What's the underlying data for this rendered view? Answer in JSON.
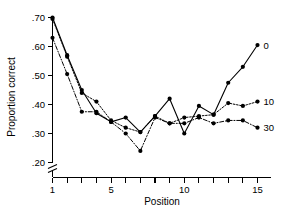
{
  "chart_data": {
    "type": "line",
    "title": "",
    "xlabel": "Position",
    "ylabel": "Proportion correct",
    "xlim": [
      1,
      15
    ],
    "ylim": [
      0.2,
      0.7
    ],
    "grid": false,
    "axis_break_y": true,
    "legend_position": "right-inline",
    "x": [
      1,
      2,
      3,
      4,
      5,
      6,
      7,
      8,
      9,
      10,
      11,
      12,
      13,
      14,
      15
    ],
    "xticks": [
      1,
      2,
      3,
      4,
      5,
      6,
      7,
      8,
      9,
      10,
      11,
      12,
      13,
      14,
      15
    ],
    "xtick_labels": [
      "1",
      "",
      "",
      "",
      "5",
      "",
      "",
      "",
      "",
      "10",
      "",
      "",
      "",
      "",
      "15"
    ],
    "yticks": [
      0.2,
      0.3,
      0.4,
      0.5,
      0.6,
      0.7
    ],
    "ytick_labels": [
      ".20",
      ".30",
      ".40",
      ".50",
      ".60",
      ".70"
    ],
    "series": [
      {
        "name": "0",
        "label": "0",
        "style": "solid",
        "marker": "filled-circle",
        "values": [
          0.7,
          0.57,
          0.45,
          0.37,
          0.34,
          0.355,
          0.305,
          0.36,
          0.42,
          0.3,
          0.395,
          0.365,
          0.475,
          0.53,
          0.605
        ]
      },
      {
        "name": "10",
        "label": "10",
        "style": "dotted",
        "marker": "filled-circle",
        "values": [
          0.695,
          0.565,
          0.44,
          0.41,
          0.345,
          0.32,
          0.305,
          0.36,
          0.335,
          0.355,
          0.36,
          0.365,
          0.405,
          0.395,
          0.41
        ]
      },
      {
        "name": "30",
        "label": "30",
        "style": "dashdot",
        "marker": "filled-circle",
        "values": [
          0.63,
          0.505,
          0.375,
          0.375,
          0.34,
          0.3,
          0.24,
          0.355,
          0.335,
          0.335,
          0.355,
          0.335,
          0.345,
          0.345,
          0.32
        ]
      }
    ]
  },
  "axes": {
    "y_title": "Proportion correct",
    "x_title": "Position"
  }
}
